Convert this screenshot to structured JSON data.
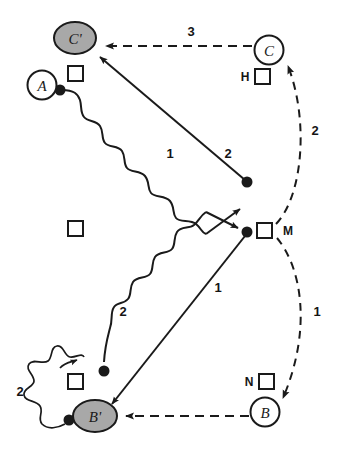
{
  "diagram": {
    "title": "",
    "colors": {
      "stroke": "#1a1a1a",
      "shaded_fill": "#a8a8a8",
      "open_fill": "#ffffff",
      "background": "#ffffff"
    },
    "nodes": [
      {
        "id": "Cprime",
        "label": "C'",
        "shape": "ellipse-shaded",
        "cx": 75,
        "cy": 38,
        "rx": 20,
        "ry": 15
      },
      {
        "id": "A",
        "label": "A",
        "shape": "circle-open",
        "cx": 42,
        "cy": 85,
        "r": 14
      },
      {
        "id": "C",
        "label": "C",
        "shape": "circle-open",
        "cx": 269,
        "cy": 50,
        "r": 14
      },
      {
        "id": "Bprime",
        "label": "B'",
        "shape": "ellipse-shaded",
        "cx": 95,
        "cy": 416,
        "rx": 21,
        "ry": 15
      },
      {
        "id": "B",
        "label": "B",
        "shape": "circle-open",
        "cx": 265,
        "cy": 412,
        "r": 14
      }
    ],
    "squares": [
      {
        "id": "sq-a",
        "tag": "",
        "x": 75,
        "y": 73
      },
      {
        "id": "sq-h",
        "tag": "H",
        "x": 262,
        "y": 76
      },
      {
        "id": "sq-mid",
        "tag": "",
        "x": 75,
        "y": 228
      },
      {
        "id": "sq-m",
        "tag": "M",
        "x": 264,
        "y": 230
      },
      {
        "id": "sq-bl",
        "tag": "",
        "x": 75,
        "y": 381
      },
      {
        "id": "sq-n",
        "tag": "N",
        "x": 266,
        "y": 381
      }
    ],
    "square_tags": [
      {
        "id": "tag-h",
        "text": "H",
        "x": 245,
        "y": 81
      },
      {
        "id": "tag-m",
        "text": "M",
        "x": 288,
        "y": 235
      },
      {
        "id": "tag-n",
        "text": "N",
        "x": 249,
        "y": 386
      }
    ],
    "dots": [
      {
        "id": "dot-a",
        "cx": 60,
        "cy": 90
      },
      {
        "id": "dot-upper",
        "cx": 247,
        "cy": 182
      },
      {
        "id": "dot-m",
        "cx": 247,
        "cy": 232
      },
      {
        "id": "dot-wave2",
        "cx": 104,
        "cy": 371
      },
      {
        "id": "dot-bprime",
        "cx": 69,
        "cy": 420
      }
    ],
    "edge_labels": [
      {
        "id": "label-3-top",
        "text": "3",
        "x": 191,
        "y": 36
      },
      {
        "id": "label-1-wave-upper",
        "text": "1",
        "x": 170,
        "y": 158
      },
      {
        "id": "label-2-diag-upper",
        "text": "2",
        "x": 228,
        "y": 158
      },
      {
        "id": "label-2-dashed-right-upper",
        "text": "2",
        "x": 315,
        "y": 135
      },
      {
        "id": "label-2-wave-lower",
        "text": "2",
        "x": 123,
        "y": 316
      },
      {
        "id": "label-1-diag-lower",
        "text": "1",
        "x": 218,
        "y": 292
      },
      {
        "id": "label-1-dashed-right-lower",
        "text": "1",
        "x": 317,
        "y": 316
      },
      {
        "id": "label-2-star-left",
        "text": "2",
        "x": 20,
        "y": 396
      }
    ],
    "edges": [
      {
        "id": "edge-c-to-cprime",
        "style": "dashed",
        "from": "C",
        "to": "Cprime",
        "label": "3"
      },
      {
        "id": "edge-m-to-cprime",
        "style": "solid",
        "from": "dot-upper",
        "to": "Cprime",
        "label": "2"
      },
      {
        "id": "edge-a-wave-to-m",
        "style": "wavy",
        "from": "A",
        "to": "M",
        "label": "1"
      },
      {
        "id": "edge-m-dashed-to-c",
        "style": "dashed-curve",
        "from": "M",
        "to": "C",
        "label": "2"
      },
      {
        "id": "edge-m-to-bprime",
        "style": "solid",
        "from": "dot-m",
        "to": "Bprime",
        "label": "1"
      },
      {
        "id": "edge-wave-lower",
        "style": "wavy",
        "from": "M",
        "to": "dot-wave2",
        "label": "2"
      },
      {
        "id": "edge-m-dashed-to-b",
        "style": "dashed-curve",
        "from": "M",
        "to": "B",
        "label": "1"
      },
      {
        "id": "edge-b-to-bprime",
        "style": "dashed",
        "from": "B",
        "to": "Bprime",
        "label": ""
      },
      {
        "id": "edge-star-left",
        "style": "jagged",
        "from": "dot-bprime",
        "to": "sq-bl",
        "label": "2"
      }
    ]
  }
}
